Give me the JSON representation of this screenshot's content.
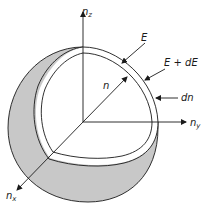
{
  "figure": {
    "colors": {
      "line": "#1a1a1a",
      "shell_fill": "#c8c8c8",
      "background": "#ffffff"
    },
    "axes": {
      "z": {
        "label": "n",
        "subscript": "z"
      },
      "y": {
        "label": "n",
        "subscript": "y"
      },
      "x": {
        "label": "n",
        "subscript": "x"
      }
    },
    "labels": {
      "radius": "n",
      "inner_surface": "E",
      "outer_surface": "E + dE",
      "thickness": "dn"
    }
  }
}
